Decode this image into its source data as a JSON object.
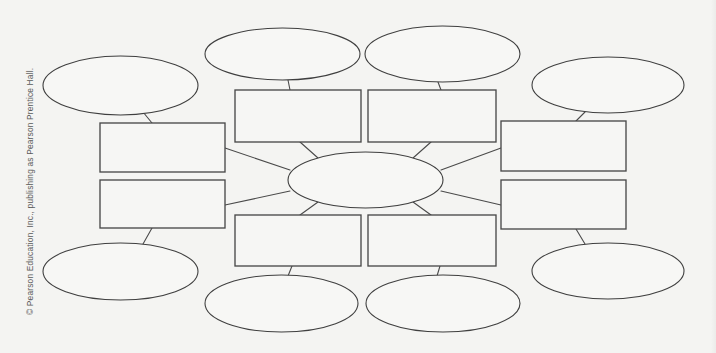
{
  "page": {
    "background_color": "#f4f4f2",
    "stroke_color": "#4a4a4a",
    "shape_fill": "#f7f7f5",
    "copyright": "© Pearson Education, Inc., publishing as Pearson Prentice Hall."
  },
  "diagram": {
    "type": "graphic-organizer",
    "center": {
      "label": "",
      "cx": 365.5,
      "cy": 180,
      "rx": 77.5,
      "ry": 28
    },
    "rectangles": [
      {
        "id": "rect-left-upper",
        "label": "",
        "x": 100,
        "y": 123,
        "w": 125,
        "h": 49
      },
      {
        "id": "rect-left-lower",
        "label": "",
        "x": 100,
        "y": 180,
        "w": 125,
        "h": 48
      },
      {
        "id": "rect-top-left",
        "label": "",
        "x": 235,
        "y": 90,
        "w": 126,
        "h": 52
      },
      {
        "id": "rect-top-right",
        "label": "",
        "x": 368,
        "y": 90,
        "w": 128,
        "h": 52
      },
      {
        "id": "rect-right-upper",
        "label": "",
        "x": 501,
        "y": 121,
        "w": 125,
        "h": 50
      },
      {
        "id": "rect-right-lower",
        "label": "",
        "x": 501,
        "y": 180,
        "w": 125,
        "h": 49
      },
      {
        "id": "rect-bottom-left",
        "label": "",
        "x": 235,
        "y": 215,
        "w": 126,
        "h": 51
      },
      {
        "id": "rect-bottom-right",
        "label": "",
        "x": 368,
        "y": 215,
        "w": 128,
        "h": 51
      }
    ],
    "ellipses": [
      {
        "id": "ellipse-top-left-corner",
        "label": "",
        "cx": 120.5,
        "cy": 85.5,
        "rx": 77.5,
        "ry": 29.5
      },
      {
        "id": "ellipse-top-center-left",
        "label": "",
        "cx": 282.5,
        "cy": 54,
        "rx": 77.5,
        "ry": 26
      },
      {
        "id": "ellipse-top-center-right",
        "label": "",
        "cx": 442.5,
        "cy": 54,
        "rx": 77.5,
        "ry": 28
      },
      {
        "id": "ellipse-top-right-corner",
        "label": "",
        "cx": 608,
        "cy": 85,
        "rx": 76,
        "ry": 28
      },
      {
        "id": "ellipse-bottom-left-corner",
        "label": "",
        "cx": 120.5,
        "cy": 271.5,
        "rx": 77.5,
        "ry": 28.5
      },
      {
        "id": "ellipse-bottom-center-left",
        "label": "",
        "cx": 281.5,
        "cy": 303.5,
        "rx": 76.5,
        "ry": 28.5
      },
      {
        "id": "ellipse-bottom-center-right",
        "label": "",
        "cx": 443,
        "cy": 303.5,
        "rx": 77,
        "ry": 28.5
      },
      {
        "id": "ellipse-bottom-right-corner",
        "label": "",
        "cx": 608,
        "cy": 271,
        "rx": 76,
        "ry": 28
      }
    ],
    "connectors": [
      {
        "id": "connector-center-to-top-left",
        "from": "center",
        "to": "rect-top-left",
        "x1": 318,
        "y1": 158,
        "x2": 300,
        "y2": 142
      },
      {
        "id": "connector-center-to-top-right",
        "from": "center",
        "to": "rect-top-right",
        "x1": 413,
        "y1": 158,
        "x2": 431,
        "y2": 142
      },
      {
        "id": "connector-center-to-bottom-left",
        "from": "center",
        "to": "rect-bottom-left",
        "x1": 318,
        "y1": 202,
        "x2": 300,
        "y2": 215
      },
      {
        "id": "connector-center-to-bottom-right",
        "from": "center",
        "to": "rect-bottom-right",
        "x1": 413,
        "y1": 202,
        "x2": 431,
        "y2": 215
      },
      {
        "id": "connector-center-to-left-upper",
        "from": "center",
        "to": "rect-left-upper",
        "x1": 290,
        "y1": 170,
        "x2": 225,
        "y2": 148
      },
      {
        "id": "connector-center-to-left-lower",
        "from": "center",
        "to": "rect-left-lower",
        "x1": 290,
        "y1": 191,
        "x2": 225,
        "y2": 205
      },
      {
        "id": "connector-center-to-right-upper",
        "from": "center",
        "to": "rect-right-upper",
        "x1": 441,
        "y1": 170,
        "x2": 501,
        "y2": 148
      },
      {
        "id": "connector-center-to-right-lower",
        "from": "center",
        "to": "rect-right-lower",
        "x1": 441,
        "y1": 191,
        "x2": 501,
        "y2": 205
      },
      {
        "id": "connector-ellipse-top-left",
        "from": "ellipse-top-left-corner",
        "to": "rect-left-upper",
        "x1": 143,
        "y1": 112,
        "x2": 152,
        "y2": 123
      },
      {
        "id": "connector-ellipse-top-center-left",
        "from": "ellipse-top-center-left",
        "to": "rect-top-left",
        "x1": 288,
        "y1": 80,
        "x2": 290,
        "y2": 90
      },
      {
        "id": "connector-ellipse-top-center-right",
        "from": "ellipse-top-center-right",
        "to": "rect-top-right",
        "x1": 438,
        "y1": 82,
        "x2": 441,
        "y2": 90
      },
      {
        "id": "connector-ellipse-top-right",
        "from": "ellipse-top-right-corner",
        "to": "rect-right-upper",
        "x1": 585,
        "y1": 112,
        "x2": 576,
        "y2": 121
      },
      {
        "id": "connector-ellipse-bottom-left",
        "from": "ellipse-bottom-left-corner",
        "to": "rect-left-lower",
        "x1": 143,
        "y1": 244,
        "x2": 152,
        "y2": 228
      },
      {
        "id": "connector-ellipse-bottom-center-left",
        "from": "ellipse-bottom-center-left",
        "to": "rect-bottom-left",
        "x1": 288,
        "y1": 276,
        "x2": 292,
        "y2": 266
      },
      {
        "id": "connector-ellipse-bottom-center-right",
        "from": "ellipse-bottom-center-right",
        "to": "rect-bottom-right",
        "x1": 437,
        "y1": 276,
        "x2": 440,
        "y2": 266
      },
      {
        "id": "connector-ellipse-bottom-right",
        "from": "ellipse-bottom-right-corner",
        "to": "rect-right-lower",
        "x1": 585,
        "y1": 244,
        "x2": 576,
        "y2": 229
      }
    ]
  }
}
